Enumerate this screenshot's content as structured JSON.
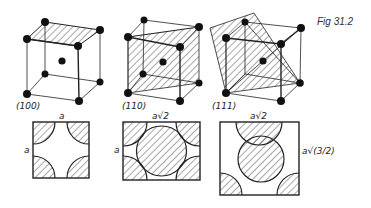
{
  "figure_label": "Fig 31.2",
  "cubes": [
    {
      "plane": "(100)",
      "label": "(100)"
    },
    {
      "plane": "(110)",
      "label": "(110)"
    },
    {
      "plane": "(111)",
      "label": "(111)"
    }
  ],
  "sections": [
    {
      "plane": "(100)",
      "top_dim": "a",
      "side_dim": "a"
    },
    {
      "plane": "(110)",
      "top_dim": "a√2",
      "side_dim": "a"
    },
    {
      "plane": "(111)",
      "top_dim": "a√2",
      "side_dim": "a√(3/2)"
    }
  ],
  "colors": {
    "ink": "#1a1a1a",
    "background": "#ffffff"
  }
}
